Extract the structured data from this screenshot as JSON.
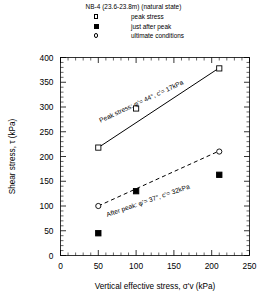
{
  "legend": {
    "title": "NB-4 (23.6-23.8m) (natural state)",
    "items": [
      {
        "label": "peak stress",
        "marker": "open-square"
      },
      {
        "label": "just after peak",
        "marker": "filled-square"
      },
      {
        "label": "ultimate conditions",
        "marker": "open-circle"
      }
    ]
  },
  "chart_data": {
    "type": "scatter",
    "title": "NB-4 (23.6-23.8m) (natural state)",
    "xlabel": "Vertical effective stress, σ'v (kPa)",
    "ylabel": "Shear stress, τ (kPa)",
    "xlim": [
      0,
      250
    ],
    "ylim": [
      0,
      400
    ],
    "xticks": [
      0,
      50,
      100,
      150,
      200,
      250
    ],
    "yticks": [
      0,
      50,
      100,
      150,
      200,
      250,
      300,
      350,
      400
    ],
    "x_minor_step": 10,
    "y_minor_step": 10,
    "grid": false,
    "legend_position": "top-center",
    "series": [
      {
        "name": "peak stress",
        "marker": "open-square",
        "points": [
          {
            "x": 50,
            "y": 218
          },
          {
            "x": 100,
            "y": 297
          },
          {
            "x": 210,
            "y": 378
          }
        ],
        "fit": {
          "style": "solid",
          "x_start": 50,
          "y_start": 218,
          "x_end": 211,
          "y_end": 380
        }
      },
      {
        "name": "just after peak",
        "marker": "filled-square",
        "points": [
          {
            "x": 50,
            "y": 45
          },
          {
            "x": 100,
            "y": 130
          },
          {
            "x": 210,
            "y": 163
          }
        ],
        "fit": null
      },
      {
        "name": "ultimate conditions",
        "marker": "open-circle",
        "points": [
          {
            "x": 50,
            "y": 100
          },
          {
            "x": 210,
            "y": 210
          }
        ],
        "fit": {
          "style": "dashed",
          "x_start": 50,
          "y_start": 100,
          "x_end": 211,
          "y_end": 212
        }
      }
    ],
    "annotations": [
      {
        "text": "Peak stress: φ'= 44°, c'= 17kPa",
        "x": 53,
        "y": 268,
        "rotation": -25
      },
      {
        "text": "After peak: φ'= 37°, c'= 32kPa",
        "x": 62,
        "y": 78,
        "rotation": -19
      }
    ]
  },
  "axes": {
    "x_tick_labels": [
      "0",
      "50",
      "100",
      "150",
      "200",
      "250"
    ],
    "y_tick_labels": [
      "0",
      "50",
      "100",
      "150",
      "200",
      "250",
      "300",
      "350",
      "400"
    ],
    "x_title": "Vertical effective stress, σ'v (kPa)",
    "y_title": "Shear stress, τ (kPa)"
  }
}
